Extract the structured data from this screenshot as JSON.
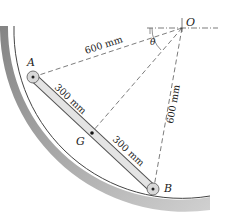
{
  "diagram": {
    "points": {
      "O": "O",
      "A": "A",
      "B": "B",
      "G": "G"
    },
    "angle_label": "θ",
    "dimensions": {
      "OA": "600 mm",
      "OB": "600 mm",
      "AG": "300 mm",
      "GB": "300 mm"
    },
    "colors": {
      "surface_shade": "#8a8a8a",
      "bar_fill": "#e4e4e4",
      "line": "#333333"
    }
  }
}
